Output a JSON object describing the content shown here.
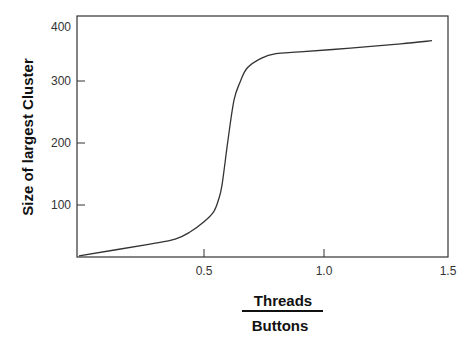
{
  "chart_data": {
    "type": "line",
    "title": "",
    "xlabel": {
      "numerator": "Threads",
      "denominator": "Buttons"
    },
    "ylabel": "Size of largest Cluster",
    "xlim": [
      0,
      1.5
    ],
    "ylim": [
      16,
      405
    ],
    "x_ticks": [
      0.5,
      1.0,
      1.5
    ],
    "x_tick_labels": [
      "0.5",
      "1.0",
      "1.5"
    ],
    "y_ticks": [
      100,
      200,
      300,
      400
    ],
    "y_tick_labels": [
      "100",
      "200",
      "300",
      "400"
    ],
    "grid": false,
    "legend": null,
    "series": [
      {
        "name": "Size of largest Cluster",
        "color": "#333333",
        "x": [
          0.0,
          0.275,
          0.38,
          0.44,
          0.5,
          0.54,
          0.56,
          0.575,
          0.6,
          0.625,
          0.65,
          0.68,
          0.74,
          0.8,
          0.9,
          1.11,
          1.32,
          1.45
        ],
        "y": [
          18,
          37,
          45,
          56,
          73,
          89,
          108,
          132,
          205,
          269,
          298,
          321,
          337,
          344,
          347,
          353,
          360,
          365
        ]
      }
    ]
  }
}
